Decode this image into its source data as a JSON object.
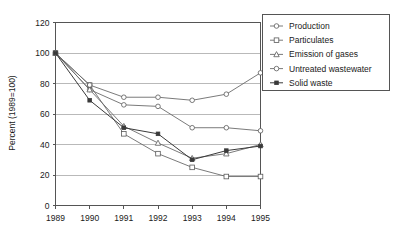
{
  "chart_data": {
    "type": "line",
    "title": "",
    "xlabel": "",
    "ylabel": "Percent (1989=100)",
    "categories": [
      "1989",
      "1990",
      "1991",
      "1992",
      "1993",
      "1994",
      "1995"
    ],
    "x": [
      1989,
      1990,
      1991,
      1992,
      1993,
      1994,
      1995
    ],
    "ylim": [
      0,
      120
    ],
    "xlim": [
      1989,
      1995
    ],
    "yticks": [
      "0",
      "20",
      "40",
      "60",
      "80",
      "100",
      "120"
    ],
    "ytick_values": [
      0,
      20,
      40,
      60,
      80,
      100,
      120
    ],
    "grid": true,
    "legend_position": "right",
    "series": [
      {
        "name": "Production",
        "marker": "circle-open",
        "values": [
          100,
          76,
          66,
          65,
          51,
          51,
          49
        ]
      },
      {
        "name": "Particulates",
        "marker": "square-open",
        "values": [
          100,
          79,
          47,
          34,
          25,
          19,
          19
        ]
      },
      {
        "name": "Emission of gases",
        "marker": "triangle-open",
        "values": [
          100,
          76,
          52,
          41,
          31,
          34,
          40
        ]
      },
      {
        "name": "Untreated wastewater",
        "marker": "circle-open",
        "values": [
          100,
          79,
          71,
          71,
          69,
          73,
          87
        ]
      },
      {
        "name": "Solid waste",
        "marker": "dot-filled",
        "values": [
          100,
          69,
          51,
          47,
          30,
          36,
          39
        ]
      }
    ]
  },
  "legend": {
    "items": [
      {
        "label": "Production"
      },
      {
        "label": "Particulates"
      },
      {
        "label": "Emission of gases"
      },
      {
        "label": "Untreated wastewater"
      },
      {
        "label": "Solid waste"
      }
    ]
  },
  "axes": {
    "y_label": "Percent (1989=100)",
    "y_ticks": [
      "120",
      "100",
      "80",
      "60",
      "40",
      "20",
      "0"
    ],
    "x_ticks": [
      "1989",
      "1990",
      "1991",
      "1992",
      "1993",
      "1994",
      "1995"
    ]
  },
  "colors": {
    "line": "#6b6b6b",
    "line_emphasis": "#3a3a3a",
    "grid": "#b9b9b9",
    "axis": "#555555",
    "text": "#1a1a1a",
    "background": "#ffffff"
  }
}
